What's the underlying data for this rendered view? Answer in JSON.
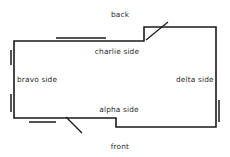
{
  "diagram": {
    "type": "floor-plan",
    "canvas": {
      "width": 230,
      "height": 157
    },
    "stroke_color": "#1a1a1a",
    "background_color": "#ffffff",
    "label_color": "#2b2b2b",
    "labels": {
      "back": "back",
      "front": "front",
      "charlie_side": "charlie side",
      "bravo_side": "bravo side",
      "delta_side": "delta side",
      "alpha_side": "alpha side"
    },
    "label_positions": {
      "back": {
        "x": 120,
        "y": 11
      },
      "charlie_side": {
        "x": 117,
        "y": 48
      },
      "bravo_side": {
        "x": 17,
        "y": 76
      },
      "delta_side": {
        "x": 176,
        "y": 76
      },
      "alpha_side": {
        "x": 119,
        "y": 106
      },
      "front": {
        "x": 120,
        "y": 143
      }
    },
    "outline_points": "14,41 144,41 144,27 216,27 216,127 116,127 116,118 14,118 14,41",
    "features": {
      "windows": [
        {
          "name": "window-top-wall",
          "x1": 56,
          "y1": 38,
          "x2": 106,
          "y2": 38
        },
        {
          "name": "window-left-wall-upper",
          "x1": 11,
          "y1": 50,
          "x2": 11,
          "y2": 65
        },
        {
          "name": "window-left-wall-lower",
          "x1": 11,
          "y1": 94,
          "x2": 11,
          "y2": 112
        },
        {
          "name": "window-right-wall",
          "x1": 219,
          "y1": 100,
          "x2": 219,
          "y2": 122
        },
        {
          "name": "window-bottom-wall",
          "x1": 29,
          "y1": 122,
          "x2": 56,
          "y2": 122
        }
      ],
      "doors": [
        {
          "name": "door-swing-back",
          "x1": 146,
          "y1": 40,
          "x2": 168,
          "y2": 22
        },
        {
          "name": "door-swing-front",
          "x1": 66,
          "y1": 117,
          "x2": 82,
          "y2": 133
        }
      ]
    }
  }
}
